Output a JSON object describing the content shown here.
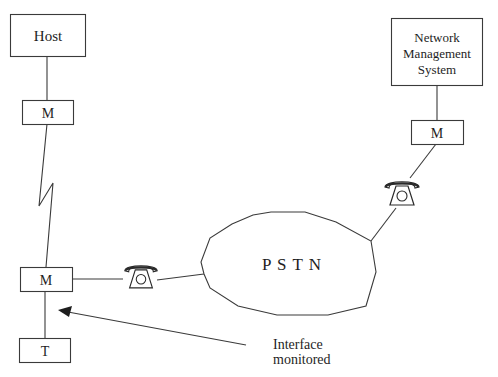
{
  "diagram": {
    "nodes": {
      "host": {
        "label": "Host"
      },
      "host_modem": {
        "label": "M"
      },
      "terminal_modem": {
        "label": "M"
      },
      "terminal": {
        "label": "T"
      },
      "nms": {
        "lines": [
          "Network",
          "Management",
          "System"
        ]
      },
      "nms_modem": {
        "label": "M"
      },
      "pstn": {
        "label": "P S T N"
      },
      "phone_left": {
        "icon": "telephone-icon"
      },
      "phone_right": {
        "icon": "telephone-icon"
      }
    },
    "annotation": {
      "lines": [
        "Interface",
        "monitored"
      ]
    },
    "edges": [
      {
        "from": "host",
        "to": "host_modem",
        "type": "line"
      },
      {
        "from": "host_modem",
        "to": "terminal_modem",
        "type": "lightning-link"
      },
      {
        "from": "terminal_modem",
        "to": "terminal",
        "type": "line"
      },
      {
        "from": "terminal_modem",
        "to": "phone_left",
        "type": "line"
      },
      {
        "from": "phone_left",
        "to": "pstn",
        "type": "line"
      },
      {
        "from": "pstn",
        "to": "phone_right",
        "type": "line"
      },
      {
        "from": "phone_right",
        "to": "nms_modem",
        "type": "line"
      },
      {
        "from": "nms_modem",
        "to": "nms",
        "type": "line"
      },
      {
        "from": "annotation",
        "to": "terminal-interface",
        "type": "arrow"
      }
    ]
  }
}
